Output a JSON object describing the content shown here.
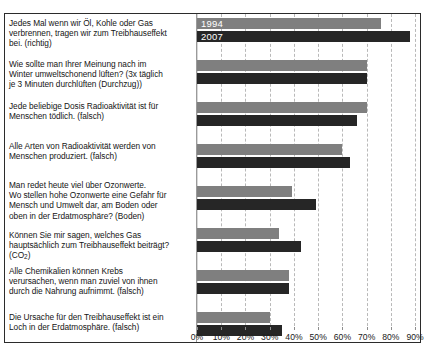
{
  "chart_data": {
    "type": "bar",
    "orientation": "horizontal",
    "title": "",
    "subtitle": "",
    "xlabel": "",
    "ylabel": "",
    "xlim": [
      0,
      92
    ],
    "xticks": [
      0,
      10,
      20,
      30,
      40,
      50,
      60,
      70,
      80,
      90
    ],
    "xticklabels": [
      "0%",
      "10%",
      "20%",
      "30%",
      "40%",
      "50%",
      "60%",
      "70%",
      "80%",
      "90%"
    ],
    "grid": true,
    "grid_axis": "x",
    "legend": [
      "1994",
      "2007"
    ],
    "legend_position": "inside-first-bars",
    "series": [
      {
        "name": "1994",
        "color": "#7f7f7f",
        "values": [
          76,
          70,
          70,
          60,
          39,
          34,
          38,
          30
        ]
      },
      {
        "name": "2007",
        "color": "#262626",
        "values": [
          88,
          70,
          66,
          63,
          49,
          43,
          38,
          35
        ]
      }
    ],
    "categories": [
      "Jedes Mal wenn wir Öl, Kohle oder Gas\nverbrennen, tragen wir zum Treibhauseffekt\nbei. (richtig)",
      "Wie sollte man Ihrer Meinung nach im\nWinter umweltschonend lüften? (3x täglich\nje 3 Minuten durchlüften (Durchzug))",
      "Jede beliebige Dosis Radioaktivität ist für\nMenschen tödlich. (falsch)",
      "Alle Arten von Radioaktivität werden von\nMenschen produziert. (falsch)",
      "Man redet heute viel über Ozonwerte.\nWo stellen hohe Ozonwerte eine Gefahr für\nMensch und Umwelt dar, am Boden oder\noben in der Erdatmosphäre? (Boden)",
      "Können Sie mir sagen, welches Gas\nhauptsächlich zum Treibhauseffekt beiträgt?\n(CO2)",
      "Alle Chemikalien können Krebs\nverursachen, wenn man zuviel von ihnen\ndurch die Nahrung aufnimmt. (falsch)",
      "Die Ursache für den Treibhauseffekt ist ein\nLoch in der Erdatmosphäre. (falsch)"
    ]
  },
  "labels": {
    "q1": "Jedes Mal wenn wir Öl, Kohle oder Gas\nverbrennen, tragen wir zum Treibhauseffekt\nbei. (richtig)",
    "q2": "Wie sollte man Ihrer Meinung nach im\nWinter umweltschonend lüften? (3x täglich\nje 3 Minuten durchlüften (Durchzug))",
    "q3": "Jede beliebige Dosis Radioaktivität ist für\nMenschen tödlich. (falsch)",
    "q4": "Alle Arten von Radioaktivität werden von\nMenschen produziert. (falsch)",
    "q5": "Man redet heute viel über Ozonwerte.\nWo stellen hohe Ozonwerte eine Gefahr für\nMensch und Umwelt dar, am Boden oder\noben in der Erdatmosphäre? (Boden)",
    "q6_line1": "Können Sie mir sagen, welches Gas",
    "q6_line2": "hauptsächlich zum Treibhauseffekt beiträgt?",
    "q6_line3_pre": "(CO",
    "q6_line3_sub": "2",
    "q6_line3_post": ")",
    "q7": "Alle Chemikalien können Krebs\nverursachen, wenn man zuviel von ihnen\ndurch die Nahrung aufnimmt. (falsch)",
    "q8": "Die Ursache für den Treibhauseffekt ist ein\nLoch in der Erdatmosphäre. (falsch)"
  },
  "legend": {
    "series1": "1994",
    "series2": "2007"
  }
}
